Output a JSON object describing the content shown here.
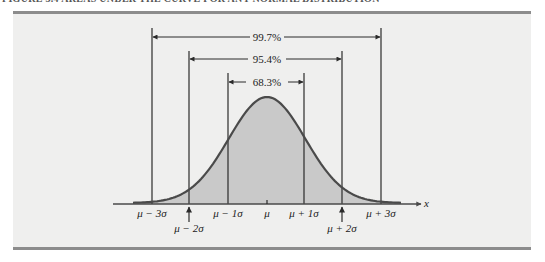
{
  "figure": {
    "title": "FIGURE 3.4   AREAS UNDER THE CURVE FOR ANY NORMAL DISTRIBUTION"
  },
  "chart_data": {
    "type": "area",
    "title": "Areas under the curve for any normal distribution",
    "xlabel": "x",
    "ylabel": "",
    "distribution": "normal",
    "x_ticks": [
      "μ − 3σ",
      "μ − 2σ",
      "μ − 1σ",
      "μ",
      "μ + 1σ",
      "μ + 2σ",
      "μ + 3σ"
    ],
    "x_tick_sigma": [
      -3,
      -2,
      -1,
      0,
      1,
      2,
      3
    ],
    "intervals": [
      {
        "label": "68.3%",
        "from_sigma": -1,
        "to_sigma": 1,
        "value": 68.3
      },
      {
        "label": "95.4%",
        "from_sigma": -2,
        "to_sigma": 2,
        "value": 95.4
      },
      {
        "label": "99.7%",
        "from_sigma": -3,
        "to_sigma": 3,
        "value": 99.7
      }
    ],
    "shaded_region": "entire area under the curve",
    "grid": false,
    "legend": "none"
  },
  "labels": {
    "x_axis": "x",
    "ticks": {
      "m3": "μ − 3σ",
      "m2": "μ − 2σ",
      "m1": "μ − 1σ",
      "mu": "μ",
      "p1": "μ + 1σ",
      "p2": "μ + 2σ",
      "p3": "μ + 3σ"
    },
    "pct": {
      "p997": "99.7%",
      "p954": "95.4%",
      "p683": "68.3%"
    }
  },
  "colors": {
    "fill": "#c9c9c9",
    "curve": "#4a4a4a",
    "lines": "#2a2a2a",
    "panel": "#efefee",
    "rule": "#8c8c8c"
  }
}
